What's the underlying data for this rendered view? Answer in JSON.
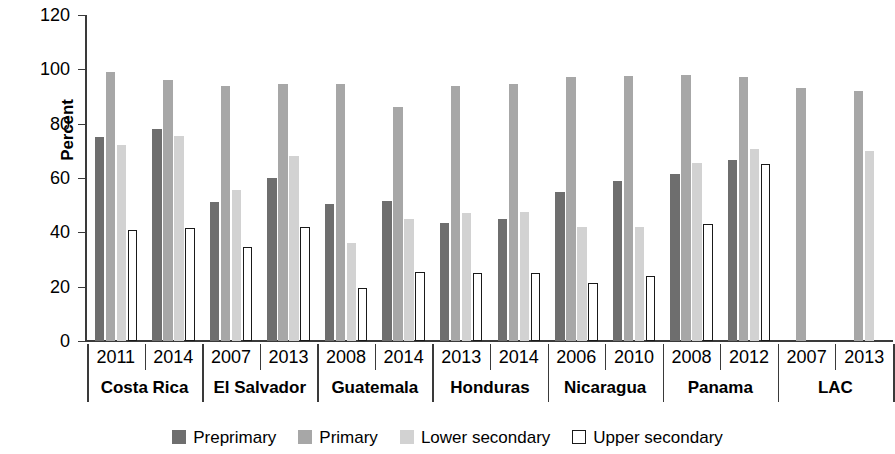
{
  "chart_data": {
    "type": "bar",
    "title": "",
    "xlabel": "",
    "ylabel": "Percent",
    "ylim": [
      0,
      120
    ],
    "yticks": [
      0,
      20,
      40,
      60,
      80,
      100,
      120
    ],
    "grid": false,
    "legend_position": "bottom",
    "legend": [
      "Preprimary",
      "Primary",
      "Lower secondary",
      "Upper secondary"
    ],
    "series": [
      {
        "name": "Preprimary",
        "color": "#6e6e6e",
        "values": [
          75,
          78,
          51,
          60,
          50.5,
          51.5,
          43.5,
          45,
          55,
          59,
          61.5,
          66.5,
          null,
          null
        ]
      },
      {
        "name": "Primary",
        "color": "#a7a7a7",
        "values": [
          99,
          96,
          94,
          94.5,
          94.5,
          86,
          94,
          94.5,
          97,
          97.5,
          98,
          97,
          93,
          92
        ]
      },
      {
        "name": "Lower secondary",
        "color": "#d2d2d2",
        "values": [
          72,
          75.5,
          55.5,
          68,
          36,
          45,
          47,
          47.5,
          42,
          42,
          65.5,
          70.5,
          null,
          70
        ]
      },
      {
        "name": "Upper secondary",
        "color": "#ffffff",
        "values": [
          41,
          41.5,
          34.5,
          42,
          19.5,
          25.5,
          25,
          25,
          21.5,
          24,
          43,
          65,
          null,
          null
        ]
      }
    ],
    "categories": [
      {
        "country": "Costa Rica",
        "year": "2011"
      },
      {
        "country": "Costa Rica",
        "year": "2014"
      },
      {
        "country": "El Salvador",
        "year": "2007"
      },
      {
        "country": "El Salvador",
        "year": "2013"
      },
      {
        "country": "Guatemala",
        "year": "2008"
      },
      {
        "country": "Guatemala",
        "year": "2014"
      },
      {
        "country": "Honduras",
        "year": "2013"
      },
      {
        "country": "Honduras",
        "year": "2014"
      },
      {
        "country": "Nicaragua",
        "year": "2006"
      },
      {
        "country": "Nicaragua",
        "year": "2010"
      },
      {
        "country": "Panama",
        "year": "2008"
      },
      {
        "country": "Panama",
        "year": "2012"
      },
      {
        "country": "LAC",
        "year": "2007"
      },
      {
        "country": "LAC",
        "year": "2013"
      }
    ],
    "country_groups": [
      {
        "label": "Costa Rica",
        "span": 2
      },
      {
        "label": "El Salvador",
        "span": 2
      },
      {
        "label": "Guatemala",
        "span": 2
      },
      {
        "label": "Honduras",
        "span": 2
      },
      {
        "label": "Nicaragua",
        "span": 2
      },
      {
        "label": "Panama",
        "span": 2
      },
      {
        "label": "LAC",
        "span": 2
      }
    ]
  }
}
